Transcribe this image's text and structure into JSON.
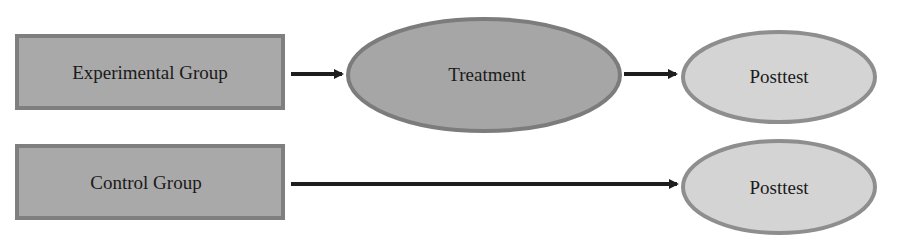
{
  "diagram": {
    "title": "",
    "colors": {
      "group_box_fill": "#a9a9a9",
      "group_box_border": "#7f7f7f",
      "treatment_fill": "#a6a6a6",
      "treatment_border": "#7c7c7c",
      "posttest_fill": "#d4d4d4",
      "posttest_border": "#8e8e8e",
      "arrow": "#1e1e1e",
      "text": "#1a1a1a"
    },
    "nodes": {
      "experimental_group": {
        "label": "Experimental Group",
        "shape": "rectangle"
      },
      "treatment": {
        "label": "Treatment",
        "shape": "ellipse"
      },
      "posttest_experimental": {
        "label": "Posttest",
        "shape": "ellipse"
      },
      "control_group": {
        "label": "Control Group",
        "shape": "rectangle"
      },
      "posttest_control": {
        "label": "Posttest",
        "shape": "ellipse"
      }
    },
    "edges": [
      {
        "from": "experimental_group",
        "to": "treatment"
      },
      {
        "from": "treatment",
        "to": "posttest_experimental"
      },
      {
        "from": "control_group",
        "to": "posttest_control"
      }
    ]
  }
}
